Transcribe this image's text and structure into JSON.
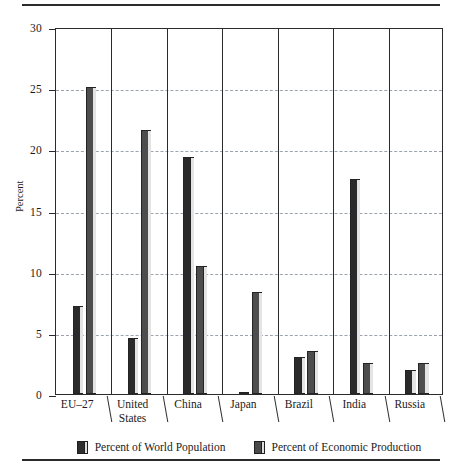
{
  "chart_data": {
    "type": "bar",
    "title": "",
    "xlabel": "",
    "ylabel": "Percent",
    "ylim": [
      0,
      30
    ],
    "yticks": [
      0,
      5,
      10,
      15,
      20,
      25,
      30
    ],
    "ytick_labels": [
      "0",
      "5",
      "10",
      "15",
      "20",
      "25",
      "30"
    ],
    "grid": "horizontal-dashed",
    "legend_position": "bottom",
    "categories": [
      "EU–27",
      "United States",
      "China",
      "Japan",
      "Brazil",
      "India",
      "Russia"
    ],
    "category_lines": [
      [
        "EU–27"
      ],
      [
        "United",
        "States"
      ],
      [
        "China"
      ],
      [
        "Japan"
      ],
      [
        "Brazil"
      ],
      [
        "India"
      ],
      [
        "Russia"
      ]
    ],
    "series": [
      {
        "name": "Percent of World Population",
        "color": "#2a2a2a",
        "values": [
          7.2,
          4.6,
          19.4,
          0.2,
          3.0,
          17.6,
          2.0
        ]
      },
      {
        "name": "Percent of Economic Production",
        "color": "#4d4d4d",
        "values": [
          25.1,
          21.6,
          10.5,
          8.3,
          3.5,
          2.5,
          2.5
        ]
      }
    ]
  },
  "axis": {
    "y_title": "Percent"
  },
  "legend": {
    "items": [
      {
        "label": "Percent of World Population"
      },
      {
        "label": "Percent of Economic Production"
      }
    ]
  }
}
